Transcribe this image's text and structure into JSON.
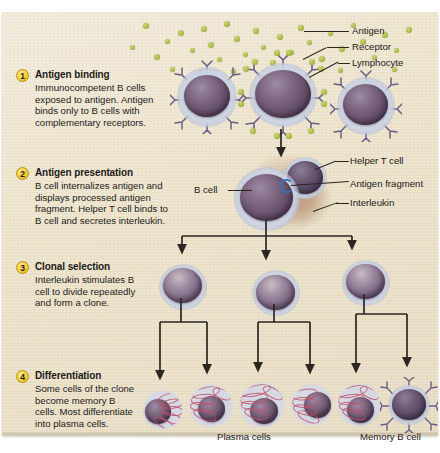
{
  "figure": {
    "background_color": "#ece3cd",
    "accent_color": "#f0c72b"
  },
  "steps": [
    {
      "number": "1",
      "title": "Antigen binding",
      "body": "Immunocompetent B cells exposed to antigen. Antigen binds only to B cells with complementary receptors."
    },
    {
      "number": "2",
      "title": "Antigen presentation",
      "body": "B cell internalizes antigen and displays processed antigen fragment. Helper T cell binds to B cell and secretes interleukin."
    },
    {
      "number": "3",
      "title": "Clonal selection",
      "body": "Interleukin stimulates B cell to divide repeatedly and form a clone."
    },
    {
      "number": "4",
      "title": "Differentiation",
      "body": "Some cells of the clone become memory B cells. Most differentiate into plasma cells."
    }
  ],
  "callouts": {
    "antigen": "Antigen",
    "receptor": "Receptor",
    "lymphocyte": "Lymphocyte",
    "b_cell": "B cell",
    "helper_t_cell": "Helper T cell",
    "antigen_fragment": "Antigen fragment",
    "interleukin": "Interleukin",
    "plasma_cells": "Plasma cells",
    "memory_b_cell": "Memory B cell"
  },
  "diagram_structure": {
    "row1_lymphocytes": 3,
    "row1_selected_index": 1,
    "row3_clone_cells": 3,
    "row4_plasma_cells": 5,
    "row4_memory_cells": 1
  }
}
